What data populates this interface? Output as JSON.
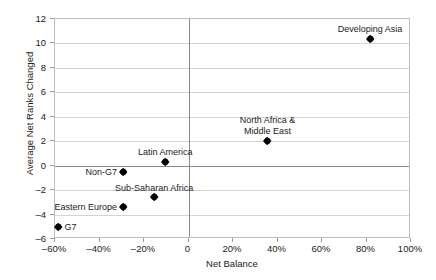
{
  "chart_data": {
    "type": "scatter",
    "title": "",
    "xlabel": "Net Balance",
    "ylabel": "Average Net Ranks Changed",
    "xlim": [
      -60,
      100
    ],
    "ylim": [
      -6,
      12
    ],
    "grid": true,
    "legend": "none",
    "xticks": [
      -60,
      -40,
      -20,
      0,
      20,
      40,
      60,
      80,
      100
    ],
    "xticklabels": [
      "–60%",
      "–40%",
      "–20%",
      "0",
      "20%",
      "40%",
      "60%",
      "80%",
      "100%"
    ],
    "yticks": [
      -6,
      -4,
      -2,
      0,
      2,
      4,
      6,
      8,
      10,
      12
    ],
    "yticklabels": [
      "–6",
      "–4",
      "–2",
      "0",
      "2",
      "4",
      "6",
      "8",
      "10",
      "12"
    ],
    "marker_color": "#000000",
    "points": [
      {
        "label": "Developing Asia",
        "x": 82,
        "y": 10.3,
        "label_pos": "above"
      },
      {
        "label": "North Africa &\nMiddle East",
        "x": 36,
        "y": 1.9,
        "label_pos": "above"
      },
      {
        "label": "Latin America",
        "x": -10,
        "y": 0.2,
        "label_pos": "above"
      },
      {
        "label": "Non-G7",
        "x": -29,
        "y": -0.6,
        "label_pos": "left"
      },
      {
        "label": "Sub-Saharan Africa",
        "x": -15,
        "y": -2.7,
        "label_pos": "above"
      },
      {
        "label": "Eastern Europe",
        "x": -29,
        "y": -3.5,
        "label_pos": "left"
      },
      {
        "label": "G7",
        "x": -58,
        "y": -5.1,
        "label_pos": "right"
      }
    ]
  }
}
